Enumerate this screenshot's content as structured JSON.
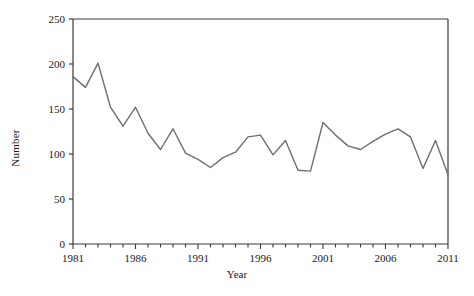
{
  "chart_data": {
    "type": "line",
    "title": "",
    "xlabel": "Year",
    "ylabel": "Number",
    "xlim": [
      1981,
      2011
    ],
    "ylim": [
      0,
      250
    ],
    "grid": false,
    "legend": null,
    "line_color": "#6e6e6e",
    "axis_color": "#3a3a3a",
    "background": "#ffffff",
    "ytick_labels": [
      "0",
      "50",
      "100",
      "150",
      "200",
      "250"
    ],
    "ytick_values": [
      0,
      50,
      100,
      150,
      200,
      250
    ],
    "xtick_labels": [
      "1981",
      "1986",
      "1991",
      "1996",
      "2001",
      "2006",
      "2011"
    ],
    "xtick_values": [
      1981,
      1986,
      1991,
      1996,
      2001,
      2006,
      2011
    ],
    "xminor_step": 1,
    "x": [
      1981,
      1982,
      1983,
      1984,
      1985,
      1986,
      1987,
      1988,
      1989,
      1990,
      1991,
      1992,
      1993,
      1994,
      1995,
      1996,
      1997,
      1998,
      1999,
      2000,
      2001,
      2002,
      2003,
      2004,
      2005,
      2006,
      2007,
      2008,
      2009,
      2010,
      2011
    ],
    "values": [
      186,
      174,
      201,
      152,
      131,
      152,
      123,
      105,
      128,
      101,
      94,
      85,
      96,
      102,
      119,
      121,
      99,
      115,
      82,
      81,
      135,
      121,
      109,
      105,
      114,
      122,
      128,
      119,
      84,
      115,
      77
    ],
    "series": [
      {
        "name": "Number",
        "values": [
          186,
          174,
          201,
          152,
          131,
          152,
          123,
          105,
          128,
          101,
          94,
          85,
          96,
          102,
          119,
          121,
          99,
          115,
          82,
          81,
          135,
          121,
          109,
          105,
          114,
          122,
          128,
          119,
          84,
          115,
          77
        ]
      }
    ]
  }
}
